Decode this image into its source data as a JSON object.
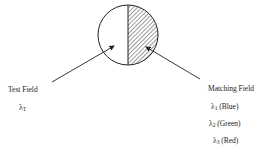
{
  "diagram": {
    "circle": {
      "cx": 128,
      "cy": 35,
      "r": 30,
      "left_half": "plain",
      "right_half": "hatched"
    },
    "test_field": {
      "label": "Test Field",
      "symbol": "λ",
      "subscript": "T"
    },
    "matching_field": {
      "label": "Matching Field",
      "items": [
        {
          "symbol": "λ",
          "subscript": "1",
          "color_name": "(Blue)"
        },
        {
          "symbol": "λ",
          "subscript": "2",
          "color_name": "(Green)"
        },
        {
          "symbol": "λ",
          "subscript": "3",
          "color_name": "(Red)"
        }
      ]
    },
    "colors": {
      "stroke": "#222222",
      "background": "#ffffff"
    }
  }
}
